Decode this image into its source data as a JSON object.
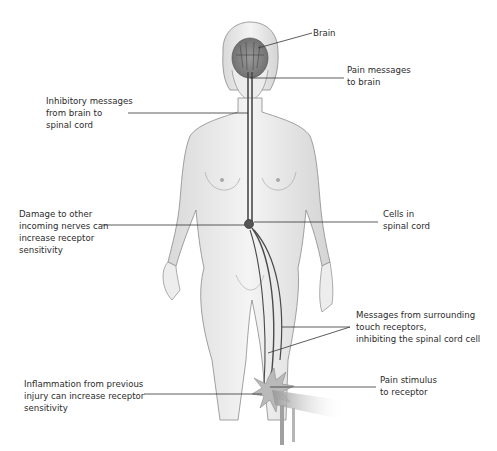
{
  "diagram": {
    "colors": {
      "background": "#ffffff",
      "skin": "#efefef",
      "skin_shadow": "#cfcfcf",
      "outline": "#8a8a8a",
      "nerve": "#4a4a4a",
      "leader_line": "#333333",
      "text": "#2b2b2b"
    },
    "labels": {
      "brain": {
        "lines": [
          "Brain"
        ]
      },
      "pain_messages": {
        "lines": [
          "Pain messages",
          "to brain"
        ]
      },
      "inhibitory": {
        "lines": [
          "Inhibitory messages",
          "from brain to",
          "spinal cord"
        ]
      },
      "damage": {
        "lines": [
          "Damage to other",
          "incoming nerves can",
          "increase receptor",
          "sensitivity"
        ]
      },
      "cells": {
        "lines": [
          "Cells in",
          "spinal cord"
        ]
      },
      "touch": {
        "lines": [
          "Messages from surrounding",
          "touch receptors,",
          "inhibiting the spinal cord cell"
        ]
      },
      "stimulus": {
        "lines": [
          "Pain stimulus",
          "to receptor"
        ]
      },
      "inflammation": {
        "lines": [
          "Inflammation from previous",
          "injury can increase receptor",
          "sensitivity"
        ]
      }
    }
  }
}
